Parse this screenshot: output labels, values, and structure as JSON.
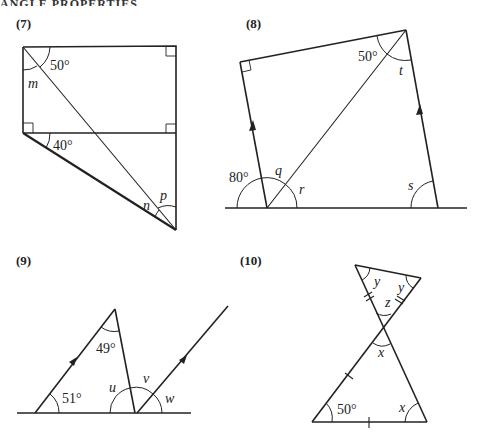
{
  "page": {
    "header_clipped": "ANGLE PROPERTIES"
  },
  "questions": [
    {
      "number": "(7)",
      "angles": {
        "given_top": "50°",
        "given_mid": "40°",
        "unknowns": [
          "m",
          "n",
          "p"
        ]
      },
      "right_angle_marks": 4
    },
    {
      "number": "(8)",
      "angles": {
        "given_top": "50°",
        "given_bottom": "80°",
        "unknowns": [
          "q",
          "r",
          "s",
          "t"
        ]
      },
      "right_angle_marks": 1,
      "parallel_arrows": 2
    },
    {
      "number": "(9)",
      "angles": {
        "given_apex": "49°",
        "given_base": "51°",
        "unknowns": [
          "u",
          "v",
          "w"
        ]
      },
      "parallel_arrows": 2
    },
    {
      "number": "(10)",
      "angles": {
        "given_base": "50°",
        "unknowns": [
          "x",
          "x",
          "y",
          "y",
          "z"
        ]
      },
      "equal_side_marks": {
        "double": 2,
        "single": 2
      }
    }
  ],
  "labels": {
    "q7": {
      "a50": "50°",
      "a40": "40°",
      "m": "m",
      "n": "n",
      "p": "p"
    },
    "q8": {
      "a50": "50°",
      "a80": "80°",
      "q": "q",
      "r": "r",
      "s": "s",
      "t": "t"
    },
    "q9": {
      "a49": "49°",
      "a51": "51°",
      "u": "u",
      "v": "v",
      "w": "w"
    },
    "q10": {
      "a50": "50°",
      "x1": "x",
      "x2": "x",
      "y1": "y",
      "y2": "y",
      "z": "z"
    }
  }
}
